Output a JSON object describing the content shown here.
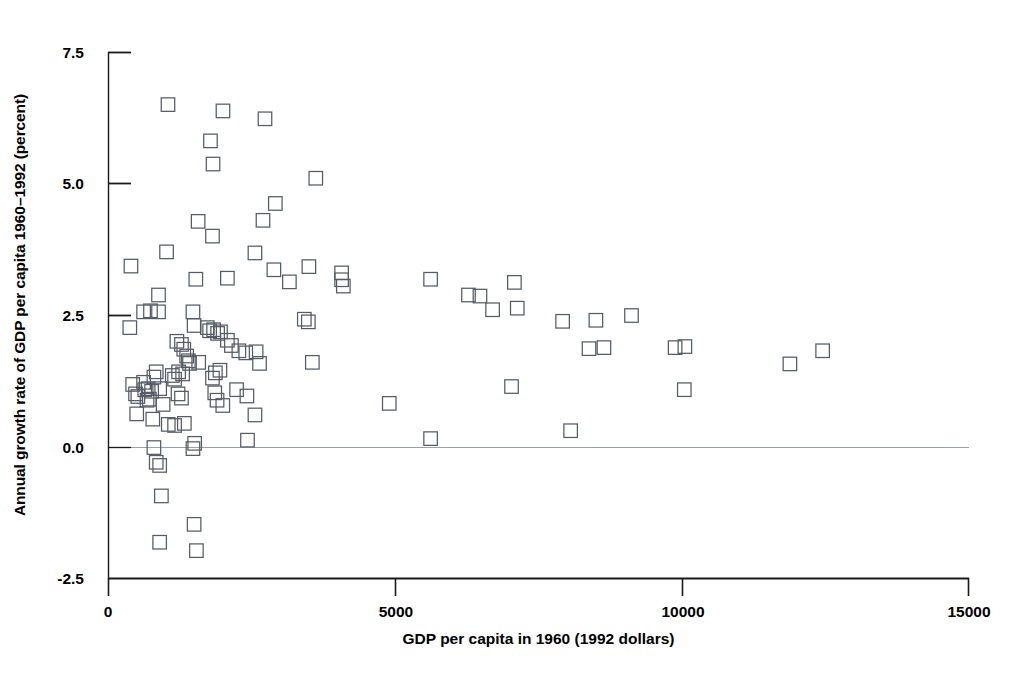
{
  "chart_data": {
    "type": "scatter",
    "title": "",
    "xlabel": "GDP per capita in 1960 (1992 dollars)",
    "ylabel": "Annual growth rate of GDP per capita 1960–1992 (percent)",
    "xlim": [
      0,
      15000
    ],
    "ylim": [
      -2.5,
      7.5
    ],
    "xticks": [
      0,
      5000,
      10000,
      15000
    ],
    "xtick_labels": [
      "0",
      "5000",
      "10000",
      "15000"
    ],
    "yticks": [
      -2.5,
      0.0,
      2.5,
      5.0,
      7.5
    ],
    "ytick_labels": [
      "-2.5",
      "0.0",
      "2.5",
      "5.0",
      "7.5"
    ],
    "grid": false,
    "legend": null,
    "marker": "open-square",
    "marker_color": "#555c66",
    "reference_line_y": 0.0,
    "points": [
      [
        1045,
        6.5
      ],
      [
        2003,
        6.38
      ],
      [
        2735,
        6.23
      ],
      [
        1785,
        5.81
      ],
      [
        1830,
        5.37
      ],
      [
        3620,
        5.1
      ],
      [
        1570,
        4.28
      ],
      [
        2915,
        4.62
      ],
      [
        2700,
        4.3
      ],
      [
        1820,
        4.0
      ],
      [
        2560,
        3.68
      ],
      [
        400,
        3.43
      ],
      [
        1020,
        3.7
      ],
      [
        2890,
        3.36
      ],
      [
        3160,
        3.13
      ],
      [
        1530,
        3.18
      ],
      [
        2080,
        3.2
      ],
      [
        880,
        2.88
      ],
      [
        3500,
        3.42
      ],
      [
        4070,
        3.3
      ],
      [
        4070,
        3.17
      ],
      [
        4100,
        3.05
      ],
      [
        5620,
        3.18
      ],
      [
        6280,
        2.88
      ],
      [
        6480,
        2.86
      ],
      [
        7080,
        3.12
      ],
      [
        6700,
        2.6
      ],
      [
        7130,
        2.63
      ],
      [
        7920,
        2.38
      ],
      [
        8500,
        2.4
      ],
      [
        9120,
        2.49
      ],
      [
        9880,
        1.88
      ],
      [
        10050,
        1.9
      ],
      [
        11880,
        1.57
      ],
      [
        12450,
        1.82
      ],
      [
        380,
        2.26
      ],
      [
        620,
        2.56
      ],
      [
        740,
        2.58
      ],
      [
        880,
        2.56
      ],
      [
        1480,
        2.56
      ],
      [
        1500,
        2.3
      ],
      [
        1730,
        2.26
      ],
      [
        1770,
        2.2
      ],
      [
        1840,
        2.22
      ],
      [
        1910,
        2.15
      ],
      [
        1960,
        2.18
      ],
      [
        2080,
        2.02
      ],
      [
        2150,
        1.92
      ],
      [
        2280,
        1.82
      ],
      [
        2400,
        1.78
      ],
      [
        3420,
        2.42
      ],
      [
        3490,
        2.37
      ],
      [
        1200,
        2.0
      ],
      [
        1280,
        1.94
      ],
      [
        1320,
        1.85
      ],
      [
        1370,
        1.72
      ],
      [
        1400,
        1.63
      ],
      [
        1420,
        1.58
      ],
      [
        1580,
        1.6
      ],
      [
        2580,
        1.8
      ],
      [
        2640,
        1.58
      ],
      [
        3560,
        1.6
      ],
      [
        1230,
        1.42
      ],
      [
        1300,
        1.38
      ],
      [
        1820,
        1.3
      ],
      [
        1870,
        1.4
      ],
      [
        1950,
        1.45
      ],
      [
        7030,
        1.14
      ],
      [
        10040,
        1.08
      ],
      [
        8380,
        1.86
      ],
      [
        8640,
        1.88
      ],
      [
        430,
        1.18
      ],
      [
        480,
        1.0
      ],
      [
        520,
        0.95
      ],
      [
        620,
        1.22
      ],
      [
        640,
        1.08
      ],
      [
        680,
        0.88
      ],
      [
        700,
        1.1
      ],
      [
        720,
        0.9
      ],
      [
        760,
        1.05
      ],
      [
        800,
        1.32
      ],
      [
        840,
        1.42
      ],
      [
        900,
        1.1
      ],
      [
        960,
        0.8
      ],
      [
        1120,
        1.35
      ],
      [
        1160,
        1.28
      ],
      [
        1220,
        1.0
      ],
      [
        1280,
        0.92
      ],
      [
        1860,
        1.02
      ],
      [
        1900,
        0.88
      ],
      [
        2000,
        0.78
      ],
      [
        2240,
        1.08
      ],
      [
        2420,
        0.96
      ],
      [
        2560,
        0.6
      ],
      [
        4900,
        0.82
      ],
      [
        500,
        0.62
      ],
      [
        780,
        0.52
      ],
      [
        1050,
        0.42
      ],
      [
        1160,
        0.4
      ],
      [
        1330,
        0.44
      ],
      [
        1510,
        0.06
      ],
      [
        2430,
        0.12
      ],
      [
        5620,
        0.15
      ],
      [
        8060,
        0.3
      ],
      [
        800,
        -0.02
      ],
      [
        1480,
        -0.04
      ],
      [
        840,
        -0.3
      ],
      [
        900,
        -0.36
      ],
      [
        930,
        -0.94
      ],
      [
        1500,
        -1.48
      ],
      [
        900,
        -1.82
      ],
      [
        1540,
        -1.98
      ]
    ]
  },
  "axis": {
    "x_tick_labels": [
      "0",
      "5000",
      "10000",
      "15000"
    ],
    "y_tick_labels": [
      "7.5",
      "5.0",
      "2.5",
      "0.0",
      "-2.5"
    ],
    "x_title": "GDP per capita in 1960 (1992 dollars)",
    "y_title": "Annual growth rate of GDP per capita 1960–1992 (percent)"
  },
  "colors": {
    "marker_stroke": "#555c66",
    "axis": "#1a1a1a",
    "reference_line": "#9aa0a6",
    "background": "#ffffff"
  }
}
